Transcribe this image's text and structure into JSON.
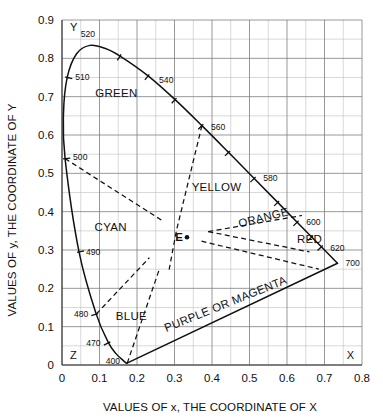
{
  "figure": {
    "type": "cie-chromaticity-diagram",
    "background": "#ffffff",
    "line_color": "#111111",
    "grid_minor_color": "#b9b9b9",
    "grid_major_color": "#7d7d7d"
  },
  "axes": {
    "x_title": "VALUES OF x, THE COORDINATE OF X",
    "y_title": "VALUES OF y, THE COORDINATE OF Y",
    "x_ticks": [
      "0",
      "0.1",
      "0.2",
      "0.3",
      "0.4",
      "0.5",
      "0.6",
      "0.7",
      "0.8"
    ],
    "y_ticks": [
      "0",
      "0.1",
      "0.2",
      "0.3",
      "0.4",
      "0.5",
      "0.6",
      "0.7",
      "0.8",
      "0.9"
    ],
    "x_corner_label": "X",
    "y_corner_label": "Y",
    "origin_corner_label": "Z"
  },
  "regions": [
    {
      "id": "green",
      "label": "GREEN",
      "x": 0.145,
      "y": 0.7,
      "rotate": 0
    },
    {
      "id": "cyan",
      "label": "CYAN",
      "x": 0.13,
      "y": 0.35,
      "rotate": 0
    },
    {
      "id": "blue",
      "label": "BLUE",
      "x": 0.185,
      "y": 0.118,
      "rotate": 0
    },
    {
      "id": "yellow",
      "label": "YELLOW",
      "x": 0.412,
      "y": 0.455,
      "rotate": 0
    },
    {
      "id": "orange",
      "label": "ORANGE",
      "x": 0.54,
      "y": 0.375,
      "rotate": -14
    },
    {
      "id": "red",
      "label": "RED",
      "x": 0.66,
      "y": 0.318,
      "rotate": 0
    },
    {
      "id": "magenta",
      "label": "PURPLE OR MAGENTA",
      "x": 0.44,
      "y": 0.15,
      "rotate": -22
    }
  ],
  "white_point": {
    "label": "E",
    "x": 0.3333,
    "y": 0.3333
  },
  "chart_data": {
    "type": "scatter",
    "title": "",
    "xlabel": "VALUES OF x, THE COORDINATE OF X",
    "ylabel": "VALUES OF y, THE COORDINATE OF Y",
    "xlim": [
      0,
      0.8
    ],
    "ylim": [
      0,
      0.9
    ],
    "grid": true,
    "grid_major_step": 0.1,
    "grid_minor_step": 0.05,
    "legend": "none",
    "spectral_locus": [
      {
        "wl": 400,
        "x": 0.1733,
        "y": 0.0048
      },
      {
        "wl": 410,
        "x": 0.1726,
        "y": 0.0048
      },
      {
        "wl": 420,
        "x": 0.1714,
        "y": 0.0051
      },
      {
        "wl": 430,
        "x": 0.1689,
        "y": 0.0069
      },
      {
        "wl": 440,
        "x": 0.1644,
        "y": 0.0109
      },
      {
        "wl": 450,
        "x": 0.1566,
        "y": 0.0177
      },
      {
        "wl": 460,
        "x": 0.144,
        "y": 0.0297
      },
      {
        "wl": 470,
        "x": 0.1241,
        "y": 0.0578
      },
      {
        "wl": 480,
        "x": 0.0913,
        "y": 0.1327
      },
      {
        "wl": 490,
        "x": 0.0454,
        "y": 0.295
      },
      {
        "wl": 500,
        "x": 0.0082,
        "y": 0.5384
      },
      {
        "wl": 505,
        "x": 0.0039,
        "y": 0.6548
      },
      {
        "wl": 510,
        "x": 0.0139,
        "y": 0.7502
      },
      {
        "wl": 515,
        "x": 0.0389,
        "y": 0.812
      },
      {
        "wl": 520,
        "x": 0.0743,
        "y": 0.8338
      },
      {
        "wl": 525,
        "x": 0.1142,
        "y": 0.8262
      },
      {
        "wl": 530,
        "x": 0.1547,
        "y": 0.8059
      },
      {
        "wl": 540,
        "x": 0.2296,
        "y": 0.7543
      },
      {
        "wl": 550,
        "x": 0.3016,
        "y": 0.6923
      },
      {
        "wl": 560,
        "x": 0.3731,
        "y": 0.6245
      },
      {
        "wl": 570,
        "x": 0.4441,
        "y": 0.5547
      },
      {
        "wl": 580,
        "x": 0.5125,
        "y": 0.4866
      },
      {
        "wl": 590,
        "x": 0.5752,
        "y": 0.4242
      },
      {
        "wl": 600,
        "x": 0.627,
        "y": 0.3725
      },
      {
        "wl": 610,
        "x": 0.6658,
        "y": 0.334
      },
      {
        "wl": 620,
        "x": 0.6915,
        "y": 0.3083
      },
      {
        "wl": 630,
        "x": 0.7079,
        "y": 0.292
      },
      {
        "wl": 640,
        "x": 0.719,
        "y": 0.2809
      },
      {
        "wl": 650,
        "x": 0.726,
        "y": 0.274
      },
      {
        "wl": 660,
        "x": 0.73,
        "y": 0.27
      },
      {
        "wl": 680,
        "x": 0.734,
        "y": 0.266
      },
      {
        "wl": 700,
        "x": 0.7347,
        "y": 0.2653
      }
    ],
    "purple_line": [
      {
        "x": 0.7347,
        "y": 0.2653
      },
      {
        "x": 0.1733,
        "y": 0.0048
      }
    ],
    "wavelength_markers": [
      {
        "wl": "520",
        "x": 0.0743,
        "y": 0.8338,
        "label_dx": -2,
        "label_dy": -8,
        "tick": false,
        "anchor": "middle"
      },
      {
        "wl": "510",
        "x": 0.0139,
        "y": 0.7502,
        "label_dx": 8,
        "label_dy": 3,
        "tick": true,
        "anchor": "start"
      },
      {
        "wl": "540",
        "x": 0.2296,
        "y": 0.7543,
        "label_dx": 11,
        "label_dy": 7,
        "tick": true,
        "anchor": "start"
      },
      {
        "wl": "500",
        "x": 0.0082,
        "y": 0.5384,
        "label_dx": 8,
        "label_dy": 1,
        "tick": true,
        "anchor": "start"
      },
      {
        "wl": "560",
        "x": 0.3731,
        "y": 0.6245,
        "label_dx": 9,
        "label_dy": 4,
        "tick": true,
        "anchor": "start"
      },
      {
        "wl": "580",
        "x": 0.5125,
        "y": 0.4866,
        "label_dx": 9,
        "label_dy": 3,
        "tick": true,
        "anchor": "start"
      },
      {
        "wl": "600",
        "x": 0.627,
        "y": 0.3725,
        "label_dx": 9,
        "label_dy": 3,
        "tick": true,
        "anchor": "start"
      },
      {
        "wl": "620",
        "x": 0.6915,
        "y": 0.3083,
        "label_dx": 9,
        "label_dy": 4,
        "tick": true,
        "anchor": "start"
      },
      {
        "wl": "700",
        "x": 0.7347,
        "y": 0.2653,
        "label_dx": 8,
        "label_dy": 3,
        "tick": false,
        "anchor": "start"
      },
      {
        "wl": "490",
        "x": 0.0454,
        "y": 0.295,
        "label_dx": 7,
        "label_dy": 3,
        "tick": true,
        "anchor": "start"
      },
      {
        "wl": "480",
        "x": 0.0913,
        "y": 0.1327,
        "label_dx": -8,
        "label_dy": 3,
        "tick": true,
        "anchor": "end"
      },
      {
        "wl": "470",
        "x": 0.1241,
        "y": 0.0578,
        "label_dx": -8,
        "label_dy": 3,
        "tick": true,
        "anchor": "end"
      },
      {
        "wl": "400",
        "x": 0.1733,
        "y": 0.0048,
        "label_dx": -7,
        "label_dy": 1,
        "tick": false,
        "anchor": "end"
      }
    ],
    "plain_ticks": [
      {
        "x": 0.1547,
        "y": 0.8059
      },
      {
        "x": 0.3016,
        "y": 0.6923
      },
      {
        "x": 0.4441,
        "y": 0.5547
      },
      {
        "x": 0.5752,
        "y": 0.4242
      },
      {
        "x": 0.6658,
        "y": 0.334
      }
    ],
    "region_dividers": [
      {
        "id": "cyan-green-divider",
        "points": [
          [
            0.0082,
            0.5384
          ],
          [
            0.27,
            0.375
          ]
        ]
      },
      {
        "id": "green-yellow-divider",
        "points": [
          [
            0.3731,
            0.6245
          ],
          [
            0.305,
            0.35
          ],
          [
            0.285,
            0.245
          ]
        ]
      },
      {
        "id": "yellow-orange-divider",
        "points": [
          [
            0.39,
            0.348
          ],
          [
            0.64,
            0.39
          ]
        ]
      },
      {
        "id": "orange-red-divider",
        "points": [
          [
            0.39,
            0.348
          ],
          [
            0.66,
            0.295
          ]
        ]
      },
      {
        "id": "red-magenta-divider",
        "points": [
          [
            0.372,
            0.323
          ],
          [
            0.685,
            0.25
          ]
        ]
      },
      {
        "id": "cyan-blue-divider",
        "points": [
          [
            0.0915,
            0.133
          ],
          [
            0.233,
            0.28
          ]
        ]
      },
      {
        "id": "blue-magenta-divider",
        "points": [
          [
            0.174,
            0.005
          ],
          [
            0.26,
            0.251
          ]
        ]
      }
    ]
  }
}
